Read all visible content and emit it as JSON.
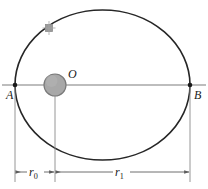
{
  "figure": {
    "kind": "orbital-ellipse-diagram",
    "background_color": "#ffffff",
    "stroke_color": "#262626",
    "thin_stroke_color": "#6e6e6e",
    "body_fill_color": "#a8a8a8",
    "body_stroke_color": "#7a7a7a",
    "satellite_fill_color": "#9a9a9a"
  },
  "labels": {
    "apoapsis_point": "A",
    "periapsis_point": "B",
    "center_body": "O",
    "distance_near": "r",
    "distance_near_sub": "0",
    "distance_far": "r",
    "distance_far_sub": "1"
  },
  "geometry": {
    "ellipse": {
      "center_x": 102.5,
      "center_y": 85,
      "radius_x": 87.5,
      "radius_y": 75
    },
    "major_axis": {
      "x1": 2,
      "x2": 206,
      "y": 85
    },
    "point_a": {
      "x": 15,
      "y": 85
    },
    "point_b": {
      "x": 190,
      "y": 85
    },
    "central_body": {
      "cx": 55,
      "cy": 85,
      "r": 11
    },
    "satellite": {
      "cx": 49,
      "cy": 28,
      "r": 4
    },
    "dimension_line_y": 172,
    "extension_lines_x": [
      15,
      55,
      190
    ],
    "extension_line_top": [
      86,
      96,
      86
    ],
    "extension_line_bottom": 182
  }
}
